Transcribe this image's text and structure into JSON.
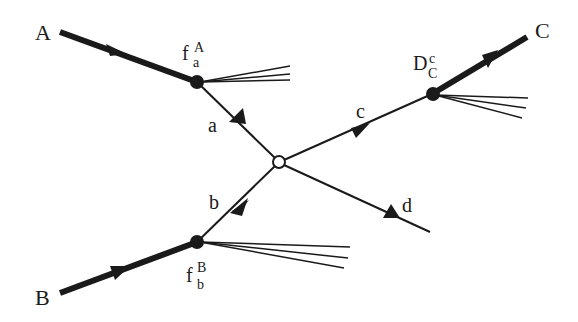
{
  "diagram": {
    "type": "feynman-factorization",
    "colors": {
      "ink": "#1a1a1a",
      "background": "#ffffff"
    },
    "particles": {
      "A": "A",
      "B": "B",
      "C": "C",
      "a": "a",
      "b": "b",
      "c": "c",
      "d": "d"
    },
    "vertices": {
      "fA": {
        "base": "f",
        "sup": "A",
        "sub": "a"
      },
      "fB": {
        "base": "f",
        "sup": "B",
        "sub": "b"
      },
      "D": {
        "base": "D",
        "sup": "c",
        "sub": "C"
      },
      "hard": {
        "shape": "open-circle"
      }
    }
  }
}
